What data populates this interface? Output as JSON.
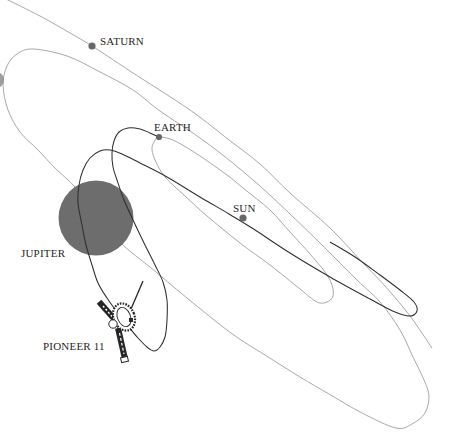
{
  "diagram": {
    "bodies": {
      "saturn": {
        "label": "SATURN"
      },
      "earth": {
        "label": "EARTH"
      },
      "sun": {
        "label": "SUN"
      },
      "jupiter": {
        "label": "JUPITER"
      }
    },
    "spacecraft": {
      "label": "PIONEER 11",
      "icon": "pioneer-spacecraft-icon"
    }
  },
  "colors": {
    "background": "#ffffff",
    "orbit_line": "#a3a3a3",
    "trajectory_line": "#2e2e2e",
    "planet_fill": "#676767",
    "jupiter_fill": "#6d6d6d",
    "label_text": "#1f1f1f"
  }
}
